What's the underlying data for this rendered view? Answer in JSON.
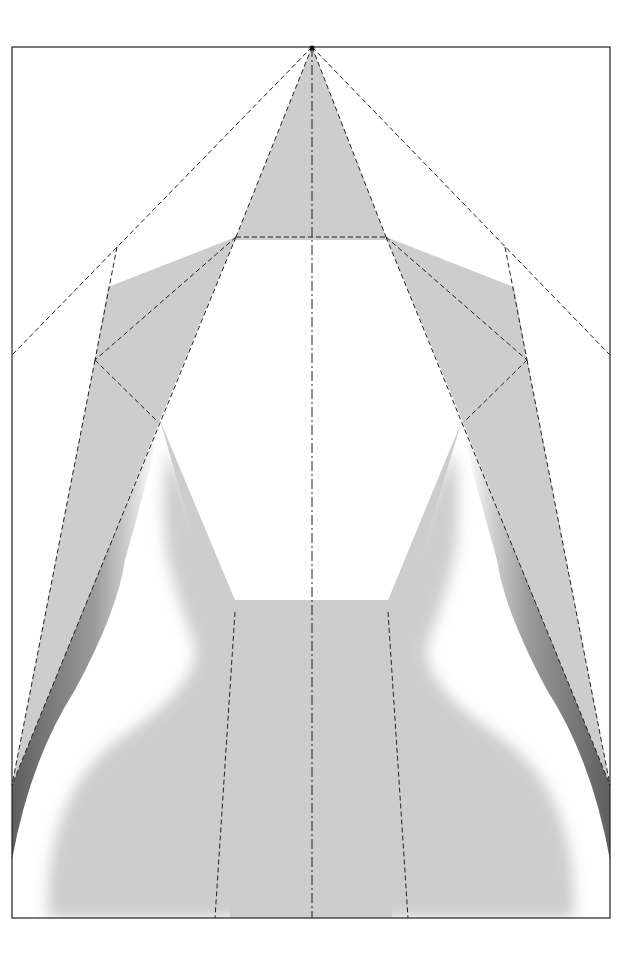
{
  "diagram": {
    "type": "origami-crease-pattern",
    "colors": {
      "background": "#ffffff",
      "paper_shade": "#cdcdcd",
      "frame": "#222222",
      "fold_line": "#222222",
      "shadow_dark": "#6a6a6a"
    },
    "frame": {
      "x": 12,
      "y": 47,
      "width": 598,
      "height": 871
    },
    "apex_point": {
      "x": 312,
      "y": 47
    },
    "center_axis_x": 312,
    "fold_line_styles": {
      "valley": "dashed",
      "center_axis": "dash-dot"
    }
  }
}
